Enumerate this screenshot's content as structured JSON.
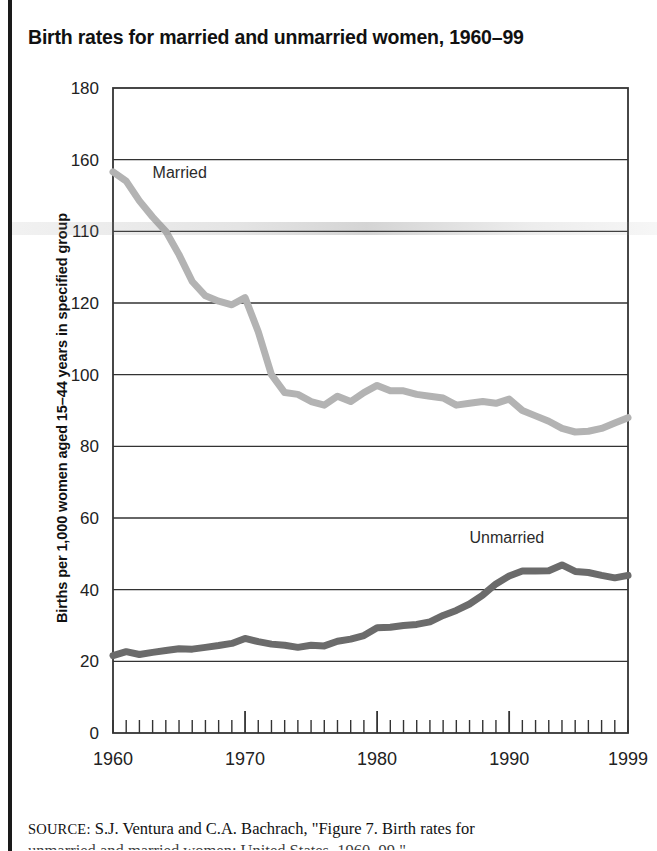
{
  "figure": {
    "title": "Birth rates for married and unmarried women, 1960–99",
    "source_keyword": "SOURCE:",
    "source_text": "S.J. Ventura and C.A. Bachrach, \"Figure 7. Birth rates for",
    "source_text_line2": "unmarried and married women: United States, 1960–99,\""
  },
  "chart_data": {
    "type": "line",
    "title": "Birth rates for married and unmarried women, 1960–99",
    "xlabel": "",
    "ylabel": "Births per 1,000 women aged 15–44 years in specified group",
    "xlim": [
      1960,
      1999
    ],
    "ylim": [
      0,
      180
    ],
    "grid": "horizontal",
    "legend_position": "inline-annotation",
    "ytick_labels": [
      "180",
      "160",
      "110",
      "120",
      "100",
      "80",
      "60",
      "40",
      "20",
      "0"
    ],
    "ytick_values": [
      180,
      160,
      140,
      120,
      100,
      80,
      60,
      40,
      20,
      0
    ],
    "ytick_note": "The 140 label is degraded in the scan and reads as 110",
    "xtick_labels": [
      "1960",
      "1970",
      "1980",
      "1990",
      "1999"
    ],
    "xtick_values": [
      1960,
      1970,
      1980,
      1990,
      1999
    ],
    "minor_xticks_every": 1,
    "x": [
      1960,
      1961,
      1962,
      1963,
      1964,
      1965,
      1966,
      1967,
      1968,
      1969,
      1970,
      1971,
      1972,
      1973,
      1974,
      1975,
      1976,
      1977,
      1978,
      1979,
      1980,
      1981,
      1982,
      1983,
      1984,
      1985,
      1986,
      1987,
      1988,
      1989,
      1990,
      1991,
      1992,
      1993,
      1994,
      1995,
      1996,
      1997,
      1998,
      1999
    ],
    "series": [
      {
        "name": "Married",
        "color": "#b3b3b3",
        "label_x": 1963,
        "label_y": 155,
        "values": [
          156.6,
          154.0,
          148.5,
          144.0,
          140.0,
          133.5,
          126.0,
          122.0,
          120.5,
          119.5,
          121.5,
          112.0,
          100.0,
          95.0,
          94.5,
          92.5,
          91.5,
          94.0,
          92.5,
          95.0,
          97.0,
          95.5,
          95.5,
          94.5,
          94.0,
          93.5,
          91.5,
          92.0,
          92.5,
          92.0,
          93.2,
          90.0,
          88.5,
          87.0,
          85.0,
          84.0,
          84.2,
          85.0,
          86.5,
          88.0
        ]
      },
      {
        "name": "Unmarried",
        "color": "#6b6b6b",
        "label_x": 1987,
        "label_y": 53,
        "values": [
          21.6,
          22.7,
          21.9,
          22.5,
          23.0,
          23.5,
          23.4,
          23.9,
          24.4,
          25.0,
          26.4,
          25.5,
          24.8,
          24.5,
          23.9,
          24.5,
          24.3,
          25.6,
          26.2,
          27.2,
          29.4,
          29.5,
          30.0,
          30.3,
          31.0,
          32.8,
          34.2,
          36.0,
          38.5,
          41.6,
          43.8,
          45.2,
          45.2,
          45.3,
          46.9,
          45.1,
          44.8,
          44.0,
          43.3,
          44.0
        ]
      }
    ]
  }
}
